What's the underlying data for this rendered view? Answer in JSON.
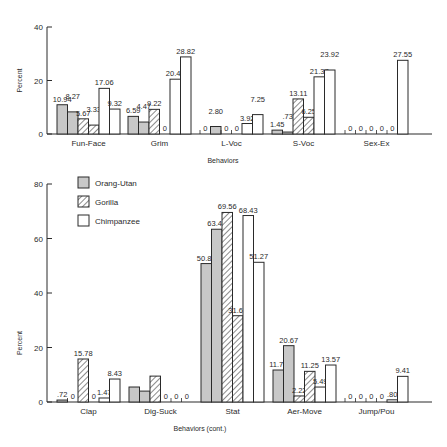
{
  "legend": [
    {
      "name": "Orang-Utan",
      "style": "gray"
    },
    {
      "name": "Gorilla",
      "style": "hatched"
    },
    {
      "name": "Chimpanzee",
      "style": "white"
    }
  ],
  "colors": {
    "gray": "#c8c8c8",
    "stroke": "#2a2a2a",
    "white": "#ffffff"
  },
  "chart_data": [
    {
      "type": "bar",
      "title": "",
      "xlabel": "Behaviors",
      "ylabel": "Percent",
      "ylim": [
        0,
        40
      ],
      "yticks": [
        0,
        20,
        40
      ],
      "categories": [
        "Fun-Face",
        "Grim",
        "L-Voc",
        "S-Voc",
        "Sex-Ex"
      ],
      "bar_series_order": [
        "Orang-Utan",
        "Orang-Utan",
        "Gorilla",
        "Gorilla",
        "Chimpanzee",
        "Chimpanzee"
      ],
      "series": [
        {
          "name": "Orang-Utan (1)",
          "values": [
            10.94,
            6.59,
            0,
            1.45,
            0
          ],
          "labels": [
            "10.94",
            "6.59",
            "0",
            "1.45",
            "0"
          ]
        },
        {
          "name": "Orang-Utan (2)",
          "values": [
            8.27,
            4.47,
            2.8,
            0.73,
            0
          ],
          "labels": [
            "8.27",
            "4.47",
            "2.80",
            ".73",
            "0"
          ]
        },
        {
          "name": "Gorilla (1)",
          "values": [
            5.67,
            9.22,
            0,
            13.11,
            0
          ],
          "labels": [
            "5.67",
            "9.22",
            "0",
            "13.11",
            "0"
          ]
        },
        {
          "name": "Gorilla (2)",
          "values": [
            3.33,
            0,
            0,
            6.25,
            0
          ],
          "labels": [
            "3.33",
            "0",
            "0",
            "6.25",
            "0"
          ]
        },
        {
          "name": "Chimpanzee (1)",
          "values": [
            17.06,
            20.49,
            3.92,
            21.37,
            0
          ],
          "labels": [
            "17.06",
            "20.49",
            "3.92",
            "21.37",
            "0"
          ]
        },
        {
          "name": "Chimpanzee (2)",
          "values": [
            9.32,
            28.82,
            7.25,
            23.92,
            27.55
          ],
          "labels": [
            "9.32",
            "28.82",
            "7.25",
            "23.92",
            "27.55"
          ]
        }
      ]
    },
    {
      "type": "bar",
      "title": "",
      "xlabel": "Behaviors (cont.)",
      "ylabel": "Percent",
      "ylim": [
        0,
        80
      ],
      "yticks": [
        0,
        20,
        40,
        60,
        80
      ],
      "categories": [
        "Clap",
        "Dig-Suck",
        "Stat",
        "Aer-Move",
        "Jump/Pou"
      ],
      "bar_series_order": [
        "Orang-Utan",
        "Orang-Utan",
        "Gorilla",
        "Gorilla",
        "Chimpanzee",
        "Chimpanzee"
      ],
      "series": [
        {
          "name": "Orang-Utan (1)",
          "values": [
            0.72,
            5.5,
            50.8,
            11.74,
            0
          ],
          "labels": [
            ".72",
            "",
            "50.80",
            "11.74",
            "0"
          ]
        },
        {
          "name": "Orang-Utan (2)",
          "values": [
            0,
            4.0,
            63.4,
            20.67,
            0
          ],
          "labels": [
            "0",
            "",
            "63.40",
            "20.67",
            "0"
          ]
        },
        {
          "name": "Gorilla (1)",
          "values": [
            15.78,
            9.5,
            69.56,
            2.22,
            0
          ],
          "labels": [
            "15.78",
            "",
            "69.56",
            "2.22",
            "0"
          ]
        },
        {
          "name": "Gorilla (2)",
          "values": [
            0,
            0,
            31.67,
            11.25,
            0
          ],
          "labels": [
            "0",
            "0",
            "31.67",
            "11.25",
            "0"
          ]
        },
        {
          "name": "Chimpanzee (1)",
          "values": [
            1.47,
            0,
            68.43,
            5.49,
            0.8
          ],
          "labels": [
            "1.47",
            "0",
            "68.43",
            "5.49",
            ".80"
          ]
        },
        {
          "name": "Chimpanzee (2)",
          "values": [
            8.43,
            0,
            51.27,
            13.57,
            9.41
          ],
          "labels": [
            "8.43",
            "0",
            "51.27",
            "13.57",
            "9.41"
          ]
        }
      ]
    }
  ]
}
